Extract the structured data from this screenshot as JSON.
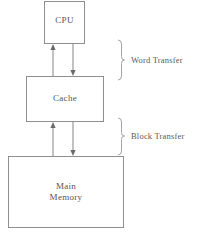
{
  "figure": {
    "caption": "",
    "background_color": "#ffffff",
    "line_color": "#8f8f8f",
    "text_color": "#555555"
  },
  "nodes": [
    {
      "id": "cpu",
      "label": "CPU",
      "x": 44,
      "y": 1,
      "w": 41,
      "h": 43
    },
    {
      "id": "cache",
      "label": "Cache",
      "x": 26,
      "y": 76,
      "w": 78,
      "h": 46
    },
    {
      "id": "memory",
      "label": "Main\nMemory",
      "x": 8,
      "y": 156,
      "w": 116,
      "h": 72
    }
  ],
  "connectors": [
    {
      "id": "cpu-up",
      "from": "cache",
      "to": "cpu",
      "direction": "up",
      "x": 53,
      "y1": 44,
      "y2": 76
    },
    {
      "id": "cache-down",
      "from": "cpu",
      "to": "cache",
      "direction": "down",
      "x": 73,
      "y1": 44,
      "y2": 76
    },
    {
      "id": "cache-up",
      "from": "memory",
      "to": "cache",
      "direction": "up",
      "x": 53,
      "y1": 122,
      "y2": 156
    },
    {
      "id": "memory-down",
      "from": "cache",
      "to": "memory",
      "direction": "down",
      "x": 73,
      "y1": 122,
      "y2": 156
    }
  ],
  "braces": [
    {
      "id": "word",
      "label": "Word Transfer",
      "x": 121,
      "y1": 40,
      "y2": 80,
      "label_x": 131,
      "label_y": 55
    },
    {
      "id": "block",
      "label": "Block Transfer",
      "x": 121,
      "y1": 118,
      "y2": 155,
      "label_x": 131,
      "label_y": 131
    }
  ]
}
